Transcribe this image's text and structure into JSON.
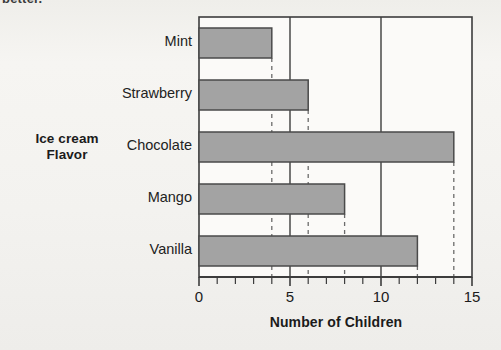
{
  "scan": {
    "fragment_text": "better."
  },
  "chart_data": {
    "type": "bar",
    "orientation": "horizontal",
    "title": "",
    "categories": [
      "Mint",
      "Strawberry",
      "Chocolate",
      "Mango",
      "Vanilla"
    ],
    "values": [
      4,
      6,
      14,
      8,
      12
    ],
    "xlabel": "Number of Children",
    "ylabel": "Ice cream\nFlavor",
    "ylabel_line1": "Ice cream",
    "ylabel_line2": "Flavor",
    "xlim": [
      0,
      15
    ],
    "xticks": [
      0,
      5,
      10,
      15
    ],
    "xtick_labels": [
      "0",
      "5",
      "10",
      "15"
    ],
    "minor_tick_step": 1,
    "gridlines": [
      5,
      10
    ],
    "grid": "vertical-major-only",
    "legend": "none",
    "bar_fill": "#a3a3a3",
    "bar_border": "#4a4a4a",
    "axis_color": "#3d3d3d",
    "dashed_guides": [
      4,
      6,
      14,
      8,
      12
    ],
    "background": "#f3f2ef"
  }
}
